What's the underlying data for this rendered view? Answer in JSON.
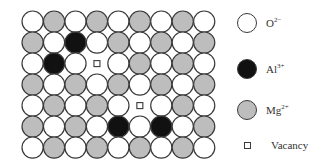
{
  "figure": {
    "title": "",
    "grid": {
      "rows": 7,
      "cols": 9,
      "legend_key": {
        "W": "O2-",
        "G": "Mg2+",
        "B": "Al3+",
        "V": "Vacancy"
      },
      "cells": [
        [
          "W",
          "G",
          "W",
          "G",
          "W",
          "G",
          "W",
          "G",
          "W"
        ],
        [
          "G",
          "W",
          "B",
          "W",
          "G",
          "W",
          "G",
          "W",
          "G"
        ],
        [
          "W",
          "B",
          "W",
          "V",
          "W",
          "G",
          "W",
          "G",
          "W"
        ],
        [
          "G",
          "W",
          "G",
          "W",
          "G",
          "W",
          "G",
          "W",
          "G"
        ],
        [
          "W",
          "G",
          "W",
          "G",
          "W",
          "V",
          "W",
          "G",
          "W"
        ],
        [
          "G",
          "W",
          "G",
          "W",
          "B",
          "W",
          "B",
          "W",
          "G"
        ],
        [
          "W",
          "G",
          "W",
          "G",
          "W",
          "G",
          "W",
          "G",
          "W"
        ]
      ]
    },
    "colors": {
      "oxygen": "#ffffff",
      "magnesium": "#bdbdbd",
      "aluminum": "#111111",
      "outline": "#3a3a3a"
    },
    "legend": [
      {
        "key": "W",
        "ion": "O",
        "charge": "2−",
        "icon": "white-circle"
      },
      {
        "key": "B",
        "ion": "Al",
        "charge": "3+",
        "icon": "black-circle"
      },
      {
        "key": "G",
        "ion": "Mg",
        "charge": "2+",
        "icon": "gray-circle"
      },
      {
        "key": "V",
        "ion": "Vacancy",
        "charge": "",
        "icon": "small-square"
      }
    ]
  }
}
